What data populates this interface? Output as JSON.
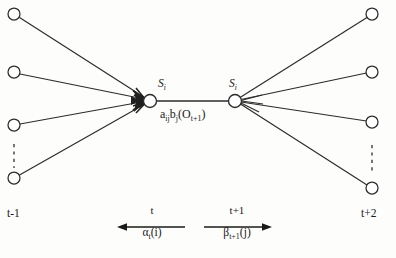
{
  "figure": {
    "type": "hmm-forward-backward-trellis",
    "ink_color": "#2b2b2b",
    "background_color": "#fdfdfc"
  },
  "nodes": {
    "left_column": [
      {
        "name": "left-state-1",
        "cx": 14,
        "cy": 14,
        "r": 6
      },
      {
        "name": "left-state-2",
        "cx": 14,
        "cy": 72,
        "r": 6
      },
      {
        "name": "left-state-3",
        "cx": 14,
        "cy": 125,
        "r": 6
      },
      {
        "name": "left-state-4",
        "cx": 14,
        "cy": 178,
        "r": 6
      }
    ],
    "right_column": [
      {
        "name": "right-state-1",
        "cx": 372,
        "cy": 14,
        "r": 6
      },
      {
        "name": "right-state-2",
        "cx": 372,
        "cy": 72,
        "r": 6
      },
      {
        "name": "right-state-3",
        "cx": 372,
        "cy": 122,
        "r": 6
      },
      {
        "name": "right-state-4",
        "cx": 372,
        "cy": 188,
        "r": 6
      }
    ],
    "center_left": {
      "name": "center-state-left",
      "cx": 150,
      "cy": 101,
      "r": 6.5
    },
    "center_right": {
      "name": "center-state-right",
      "cx": 235,
      "cy": 101,
      "r": 6.5
    }
  },
  "labels": {
    "center_left_state": {
      "base": "S",
      "sub": "i"
    },
    "center_right_state": {
      "base": "S",
      "sub": "i"
    },
    "transition_edge": {
      "a_base": "a",
      "a_sub": "ij",
      "b_base": "b",
      "b_sub": "j",
      "obs_open": "(O",
      "obs_sub": "t+1",
      "obs_close": ")"
    },
    "time_left": "t-1",
    "time_right": "t+2",
    "forward": {
      "top": "t",
      "bottom_base": "α",
      "bottom_sub": "t",
      "bottom_arg": "(i)",
      "direction": "left"
    },
    "backward": {
      "top": "t+1",
      "bottom_base": "β",
      "bottom_sub": "t+1",
      "bottom_arg": "(j)",
      "direction": "right"
    }
  },
  "ellipses": {
    "left": {
      "x": 14,
      "y_start": 144,
      "y_end": 168
    },
    "right": {
      "x": 372,
      "y_start": 145,
      "y_end": 172
    }
  }
}
